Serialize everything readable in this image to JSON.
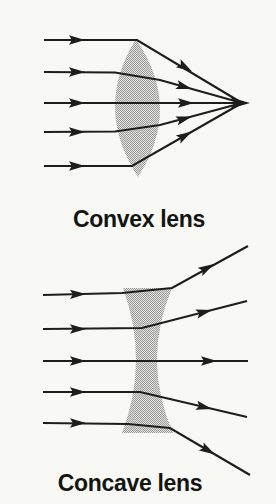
{
  "figure": {
    "style": {
      "background": "#f8f8f5",
      "line_color": "#1d1d1b",
      "label_color": "#141412",
      "stipple_light": "#e2e2de",
      "stipple_dark": "#9b9b96"
    },
    "diagrams": [
      {
        "id": "convex-lens",
        "label": "Convex lens",
        "lens_shape": "biconvex-almond",
        "lens_path": "M136 39 Q183 108 138 177 Q93 108 136 39 Z",
        "rays": [
          {
            "points": [
              [
                44,
                40
              ],
              [
                137,
                40
              ],
              [
                242,
                103
              ]
            ],
            "arrows": [
              {
                "x": 85,
                "y": 40,
                "a": 0
              },
              {
                "x": 192,
                "y": 71.5,
                "a": 31
              }
            ]
          },
          {
            "points": [
              [
                44,
                72
              ],
              [
                115,
                72.5
              ],
              [
                160,
                80
              ],
              [
                242,
                103
              ]
            ],
            "arrows": [
              {
                "x": 85,
                "y": 72,
                "a": 0
              },
              {
                "x": 192,
                "y": 89,
                "a": 16
              }
            ]
          },
          {
            "points": [
              [
                44,
                103
              ],
              [
                242,
                103
              ]
            ],
            "arrows": [
              {
                "x": 85,
                "y": 103,
                "a": 0
              },
              {
                "x": 194,
                "y": 103,
                "a": 0
              },
              {
                "x": 250,
                "y": 103,
                "a": 0,
                "s": 19
              }
            ]
          },
          {
            "points": [
              [
                44,
                132
              ],
              [
                115,
                131.5
              ],
              [
                160,
                125
              ],
              [
                242,
                103
              ]
            ],
            "arrows": [
              {
                "x": 85,
                "y": 132,
                "a": 0
              },
              {
                "x": 192,
                "y": 116.5,
                "a": -16
              }
            ]
          },
          {
            "points": [
              [
                44,
                166
              ],
              [
                132,
                166
              ],
              [
                242,
                103
              ]
            ],
            "arrows": [
              {
                "x": 85,
                "y": 166,
                "a": 0
              },
              {
                "x": 192,
                "y": 131.5,
                "a": -30
              }
            ]
          }
        ]
      },
      {
        "id": "concave-lens",
        "label": "Concave lens",
        "lens_shape": "biconcave-hourglass",
        "lens_path": "M123 288 L172 288 Q141.5 361 173 433 L122 433 Q149.5 361 123 288 Z",
        "rays": [
          {
            "points": [
              [
                43,
                295
              ],
              [
                122,
                293
              ],
              [
                172,
                288
              ],
              [
                248,
                246
              ]
            ],
            "arrows": [
              {
                "x": 86,
                "y": 294,
                "a": -1
              },
              {
                "x": 214,
                "y": 264,
                "a": -29.5
              }
            ]
          },
          {
            "points": [
              [
                43,
                329
              ],
              [
                142,
                328
              ],
              [
                247,
                301
              ]
            ],
            "arrows": [
              {
                "x": 86,
                "y": 329,
                "a": 0
              },
              {
                "x": 212,
                "y": 310,
                "a": -14.4
              }
            ]
          },
          {
            "points": [
              [
                43,
                361
              ],
              [
                248,
                361
              ]
            ],
            "arrows": [
              {
                "x": 86,
                "y": 361,
                "a": 0
              },
              {
                "x": 217,
                "y": 361,
                "a": 0
              }
            ]
          },
          {
            "points": [
              [
                43,
                392
              ],
              [
                140,
                392
              ],
              [
                247,
                417
              ]
            ],
            "arrows": [
              {
                "x": 86,
                "y": 392,
                "a": 0
              },
              {
                "x": 212,
                "y": 409,
                "a": 13.4
              }
            ]
          },
          {
            "points": [
              [
                43,
                423
              ],
              [
                128,
                424
              ],
              [
                170,
                428
              ],
              [
                250,
                475
              ]
            ],
            "arrows": [
              {
                "x": 86,
                "y": 423,
                "a": 0
              },
              {
                "x": 215,
                "y": 454.5,
                "a": 30.4
              }
            ]
          }
        ]
      }
    ]
  }
}
